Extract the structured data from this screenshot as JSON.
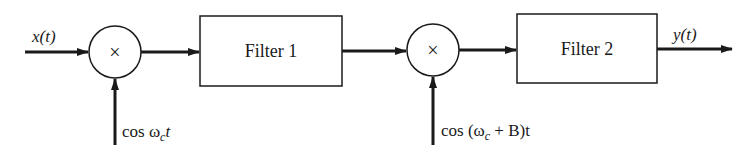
{
  "diagram": {
    "type": "block-diagram",
    "input_label": "x(t)",
    "output_label": "y(t)",
    "mixer1": {
      "symbol": "×",
      "oscillator_label_prefix": "cos ω",
      "oscillator_sub": "c",
      "oscillator_suffix": "t"
    },
    "filter1": {
      "label": "Filter 1"
    },
    "mixer2": {
      "symbol": "×",
      "oscillator_label_prefix": "cos (ω",
      "oscillator_sub": "c",
      "oscillator_suffix": " + B)t"
    },
    "filter2": {
      "label": "Filter 2"
    },
    "colors": {
      "stroke": "#1a1a1a",
      "background": "#ffffff"
    }
  }
}
